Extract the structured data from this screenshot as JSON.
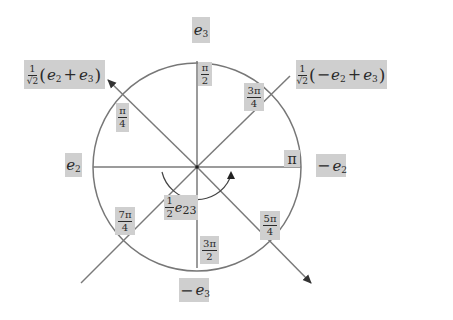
{
  "diagram": {
    "type": "unit-circle-rotor",
    "circle": {
      "cx": 197,
      "cy": 167,
      "r": 104,
      "stroke": "#777777"
    },
    "colors": {
      "label_bg": "#cfcfcf",
      "line": "#7a7a7a",
      "arrow": "#333333",
      "text": "#2a2a2a"
    },
    "axes": {
      "horizontal": {
        "x1": 93,
        "y1": 167,
        "x2": 301,
        "y2": 167
      },
      "vertical": {
        "x1": 197,
        "y1": 61,
        "x2": 197,
        "y2": 268
      }
    },
    "lines": [
      {
        "name": "diag-upper-left-arrow",
        "x1": 197,
        "y1": 167,
        "x2": 108,
        "y2": 80,
        "arrow": true
      },
      {
        "name": "diag-lower-right-arrow",
        "x1": 197,
        "y1": 167,
        "x2": 311,
        "y2": 283,
        "arrow": true
      },
      {
        "name": "diag-upper-right-line",
        "x1": 197,
        "y1": 167,
        "x2": 290,
        "y2": 76,
        "arrow": false
      },
      {
        "name": "diag-lower-left-line",
        "x1": 197,
        "y1": 167,
        "x2": 81,
        "y2": 283,
        "arrow": false
      }
    ],
    "rotation_arc": {
      "path": "M 162 172 A 36 36 0 0 0 230 178",
      "arrow_tip": {
        "x": 231,
        "y": 171
      }
    }
  },
  "labels": {
    "e3": {
      "base": "e",
      "sub": "3"
    },
    "neg_e3": {
      "sign": "−",
      "base": "e",
      "sub": "3"
    },
    "e2": {
      "base": "e",
      "sub": "2"
    },
    "neg_e2": {
      "sign": "−",
      "base": "e",
      "sub": "2"
    },
    "upper_left_vector": {
      "coef_num": "1",
      "coef_den": "√2",
      "open": "(",
      "t1_base": "e",
      "t1_sub": "2",
      "op": "+",
      "t2_base": "e",
      "t2_sub": "3",
      "close": ")"
    },
    "upper_right_vector": {
      "coef_num": "1",
      "coef_den": "√2",
      "open": "(",
      "t1_sign": "−",
      "t1_base": "e",
      "t1_sub": "2",
      "op": "+",
      "t2_base": "e",
      "t2_sub": "3",
      "close": ")"
    },
    "bivector": {
      "coef_num": "1",
      "coef_den": "2",
      "base": "e",
      "sub": "23"
    },
    "angles": {
      "pi_over_2": {
        "num": "π",
        "den": "2"
      },
      "pi_over_4": {
        "num": "π",
        "den": "4"
      },
      "three_pi_over_4": {
        "num": "3π",
        "den": "4"
      },
      "pi": {
        "text": "π"
      },
      "five_pi_over_4": {
        "num": "5π",
        "den": "4"
      },
      "three_pi_over_2": {
        "num": "3π",
        "den": "2"
      },
      "seven_pi_over_4": {
        "num": "7π",
        "den": "4"
      }
    }
  }
}
